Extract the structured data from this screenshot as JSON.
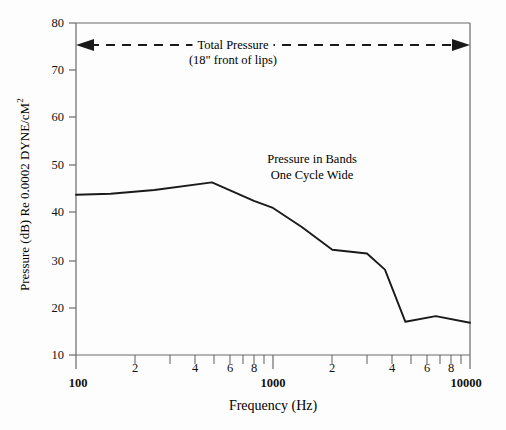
{
  "chart_data": {
    "type": "line",
    "title": "",
    "xlabel": "Frequency (Hz)",
    "ylabel": "Pressure (dB) Re 0.0002 DYNE/cM",
    "ylabel_exponent": "2",
    "xscale": "log",
    "xlim": [
      100,
      10000
    ],
    "ylim": [
      10,
      80
    ],
    "grid": false,
    "legend": "none",
    "series": [
      {
        "name": "Pressure in Bands One Cycle Wide",
        "x": [
          100,
          150,
          250,
          490,
          800,
          1000,
          1400,
          2000,
          3000,
          3700,
          4700,
          6700,
          10000
        ],
        "y": [
          43.8,
          44.0,
          44.8,
          46.4,
          42.5,
          41.0,
          37.0,
          32.2,
          31.4,
          28.0,
          17.0,
          18.2,
          16.8
        ]
      }
    ],
    "y_ticks": [
      10,
      20,
      30,
      40,
      50,
      60,
      70,
      80
    ],
    "x_major_ticks": [
      {
        "value": 100,
        "label": "100"
      },
      {
        "value": 1000,
        "label": "1000"
      },
      {
        "value": 10000,
        "label": "10000"
      }
    ],
    "x_minor_ticks": [
      {
        "value": 200,
        "label": "2"
      },
      {
        "value": 300,
        "label": ""
      },
      {
        "value": 400,
        "label": "4"
      },
      {
        "value": 500,
        "label": ""
      },
      {
        "value": 600,
        "label": "6"
      },
      {
        "value": 700,
        "label": ""
      },
      {
        "value": 800,
        "label": "8"
      },
      {
        "value": 900,
        "label": ""
      },
      {
        "value": 2000,
        "label": "2"
      },
      {
        "value": 3000,
        "label": ""
      },
      {
        "value": 4000,
        "label": "4"
      },
      {
        "value": 5000,
        "label": ""
      },
      {
        "value": 6000,
        "label": "6"
      },
      {
        "value": 7000,
        "label": ""
      },
      {
        "value": 8000,
        "label": "8"
      },
      {
        "value": 9000,
        "label": ""
      }
    ],
    "annotations": [
      {
        "name": "total-pressure",
        "line1": "Total Pressure",
        "line2": "(18\" front of lips)",
        "style": "dashed double-headed arrow spanning full width at 75 dB"
      },
      {
        "name": "pressure-in-bands",
        "line1": "Pressure in Bands",
        "line2": "One Cycle Wide",
        "style": "plain text label near curve"
      }
    ],
    "colors": {
      "curve": "#1a1a1a",
      "axis": "#6b6b6b",
      "text": "#111111",
      "background": "#fdfdfd"
    }
  }
}
